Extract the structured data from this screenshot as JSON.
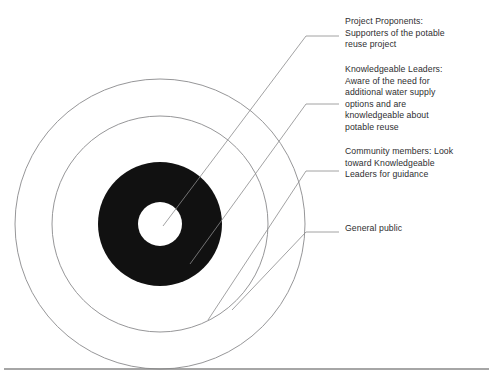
{
  "diagram": {
    "type": "concentric-circles",
    "center": {
      "x": 160,
      "y": 224
    },
    "colors": {
      "ring_stroke": "#8a8a8c",
      "filled_ring": "#111111",
      "background": "#ffffff",
      "text": "#2e2e30",
      "leader_line": "#8a8a8c",
      "rule": "#888888"
    },
    "rings": [
      {
        "name": "center-circle",
        "radius": 22,
        "fill": "#ffffff",
        "stroke": "none",
        "label_ref": 0
      },
      {
        "name": "black-ring",
        "radius": 62,
        "fill": "#111111",
        "stroke": "none",
        "label_ref": 1
      },
      {
        "name": "middle-ring",
        "radius": 108,
        "fill": "none",
        "stroke": "#8a8a8c",
        "label_ref": 2
      },
      {
        "name": "outer-ring",
        "radius": 145,
        "fill": "none",
        "stroke": "#8a8a8c",
        "label_ref": 3
      }
    ],
    "labels": [
      {
        "id": "project-proponents",
        "text": "Project Proponents:\nSupporters of the potable\nreuse project",
        "target_ring": "center-circle"
      },
      {
        "id": "knowledgeable-leaders",
        "text": "Knowledgeable Leaders:\nAware of the need for\nadditional water supply\noptions and are\nknowledgeable about\npotable reuse",
        "target_ring": "black-ring"
      },
      {
        "id": "community-members",
        "text": "Community members: Look\ntoward Knowledgeable\nLeaders for guidance",
        "target_ring": "middle-ring"
      },
      {
        "id": "general-public",
        "text": "General public",
        "target_ring": "outer-ring"
      }
    ],
    "leader_lines": [
      {
        "name": "leader-line-project-proponents",
        "points": "339,36 306,36 163,226"
      },
      {
        "name": "leader-line-knowledgeable-leaders",
        "points": "339,104 306,104 190,264"
      },
      {
        "name": "leader-line-community-members",
        "points": "339,171 306,171 208,320"
      },
      {
        "name": "leader-line-general-public",
        "points": "339,232 306,232 232,310"
      }
    ],
    "footer_rule": {
      "name": "footer-rule",
      "y": 369
    }
  }
}
